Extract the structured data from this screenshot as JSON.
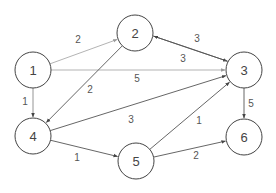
{
  "diagram": {
    "type": "directed-weighted-graph",
    "nodes": [
      {
        "id": "1",
        "label": "1",
        "x": 33,
        "y": 70
      },
      {
        "id": "2",
        "label": "2",
        "x": 135,
        "y": 33
      },
      {
        "id": "3",
        "label": "3",
        "x": 244,
        "y": 70
      },
      {
        "id": "4",
        "label": "4",
        "x": 33,
        "y": 136
      },
      {
        "id": "5",
        "label": "5",
        "x": 136,
        "y": 161
      },
      {
        "id": "6",
        "label": "6",
        "x": 244,
        "y": 137
      }
    ],
    "node_radius": 18,
    "edges": [
      {
        "from": "1",
        "to": "2",
        "weight": "2",
        "color": "#aaaaaa",
        "label_x": 78,
        "label_y": 39
      },
      {
        "from": "1",
        "to": "3",
        "weight": "5",
        "color": "#aaaaaa",
        "label_x": 137,
        "label_y": 78
      },
      {
        "from": "1",
        "to": "4",
        "weight": "1",
        "color": "#888888",
        "label_x": 25,
        "label_y": 101
      },
      {
        "from": "2",
        "to": "4",
        "weight": "2",
        "color": "#555555",
        "label_x": 90,
        "label_y": 89
      },
      {
        "from": "2",
        "to": "3",
        "weight": "3",
        "color": "#555555",
        "label_x": 197,
        "label_y": 38,
        "offset": -3
      },
      {
        "from": "3",
        "to": "2",
        "weight": "3",
        "color": "#555555",
        "label_x": 183,
        "label_y": 58,
        "offset": 3
      },
      {
        "from": "4",
        "to": "3",
        "weight": "3",
        "color": "#555555",
        "label_x": 131,
        "label_y": 119
      },
      {
        "from": "4",
        "to": "5",
        "weight": "1",
        "color": "#555555",
        "label_x": 77,
        "label_y": 157
      },
      {
        "from": "5",
        "to": "3",
        "weight": "1",
        "color": "#555555",
        "label_x": 199,
        "label_y": 120
      },
      {
        "from": "5",
        "to": "6",
        "weight": "2",
        "color": "#555555",
        "label_x": 196,
        "label_y": 155
      },
      {
        "from": "3",
        "to": "6",
        "weight": "5",
        "color": "#555555",
        "label_x": 251,
        "label_y": 103
      }
    ]
  }
}
